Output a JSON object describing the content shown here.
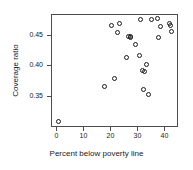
{
  "chart_data": {
    "type": "scatter",
    "title": "",
    "xlabel": "Percent below poverty line",
    "ylabel": "Coverage ratio",
    "xlim": [
      -2.0,
      45.0
    ],
    "ylim": [
      0.3,
      0.4835
    ],
    "grid": false,
    "legend": null,
    "marker": "open-circle",
    "marker_color": "#1a1a1a",
    "xticks": [
      0,
      10,
      20,
      30,
      40
    ],
    "xticklabels": [
      "0",
      "10",
      "20",
      "30",
      "40"
    ],
    "yticks": [
      0.35,
      0.4,
      0.45
    ],
    "yticklabels": [
      "0.35",
      "0.40",
      "0.45"
    ],
    "n_points": 26,
    "points": [
      {
        "x": 0.5,
        "y": 0.3105
      },
      {
        "x": 17.6,
        "y": 0.368
      },
      {
        "x": 20.0,
        "y": 0.4665
      },
      {
        "x": 21.3,
        "y": 0.3805
      },
      {
        "x": 22.2,
        "y": 0.455
      },
      {
        "x": 23.0,
        "y": 0.47
      },
      {
        "x": 25.6,
        "y": 0.414
      },
      {
        "x": 26.3,
        "y": 0.449
      },
      {
        "x": 26.9,
        "y": 0.4485
      },
      {
        "x": 27.2,
        "y": 0.447
      },
      {
        "x": 29.0,
        "y": 0.435
      },
      {
        "x": 30.4,
        "y": 0.418
      },
      {
        "x": 30.7,
        "y": 0.4755
      },
      {
        "x": 31.6,
        "y": 0.393
      },
      {
        "x": 31.8,
        "y": 0.3625
      },
      {
        "x": 32.2,
        "y": 0.3915
      },
      {
        "x": 33.1,
        "y": 0.4025
      },
      {
        "x": 33.6,
        "y": 0.355
      },
      {
        "x": 37.0,
        "y": 0.478
      },
      {
        "x": 37.4,
        "y": 0.4465
      },
      {
        "x": 38.2,
        "y": 0.4645
      },
      {
        "x": 40.8,
        "y": 0.488
      },
      {
        "x": 41.5,
        "y": 0.47
      },
      {
        "x": 42.0,
        "y": 0.467
      },
      {
        "x": 42.4,
        "y": 0.457
      },
      {
        "x": 35.0,
        "y": 0.4755
      }
    ]
  }
}
